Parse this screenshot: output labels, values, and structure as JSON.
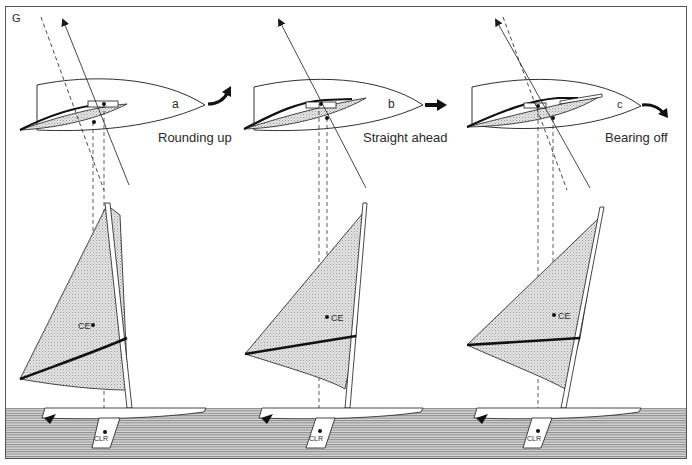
{
  "figure": {
    "label": "G",
    "colors": {
      "ink": "#1a1a1a",
      "border": "#555555",
      "sail_fill": "#d9d9d9",
      "water_fill": "#bdbdbd",
      "background": "#ffffff"
    },
    "panels": [
      {
        "id": "a",
        "letter": "a",
        "caption": "Rounding up",
        "arrow": "curve-up",
        "ce_label": "CE",
        "clr_label": "CLR"
      },
      {
        "id": "b",
        "letter": "b",
        "caption": "Straight ahead",
        "arrow": "straight",
        "ce_label": "CE",
        "clr_label": "CLR"
      },
      {
        "id": "c",
        "letter": "c",
        "caption": "Bearing off",
        "arrow": "curve-down",
        "ce_label": "CE",
        "clr_label": "CLR"
      }
    ]
  }
}
